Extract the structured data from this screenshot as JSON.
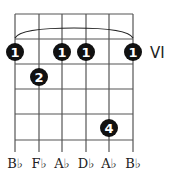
{
  "chord": {
    "position_label": "VI",
    "strings": 6,
    "frets_shown": 5,
    "string_labels": [
      "B♭",
      "F♭",
      "A♭",
      "D♭",
      "A♭",
      "B♭"
    ],
    "barre": {
      "finger": "1",
      "from_string": 1,
      "to_string": 6,
      "fret": 1
    },
    "dots": [
      {
        "string": 1,
        "fret": 1,
        "finger": "1"
      },
      {
        "string": 3,
        "fret": 1,
        "finger": "1"
      },
      {
        "string": 4,
        "fret": 1,
        "finger": "1"
      },
      {
        "string": 6,
        "fret": 1,
        "finger": "1"
      },
      {
        "string": 2,
        "fret": 2,
        "finger": "2"
      },
      {
        "string": 5,
        "fret": 4,
        "finger": "4"
      }
    ],
    "colors": {
      "grid": "#555555",
      "dot": "#111111",
      "dot_text": "#ffffff"
    }
  }
}
